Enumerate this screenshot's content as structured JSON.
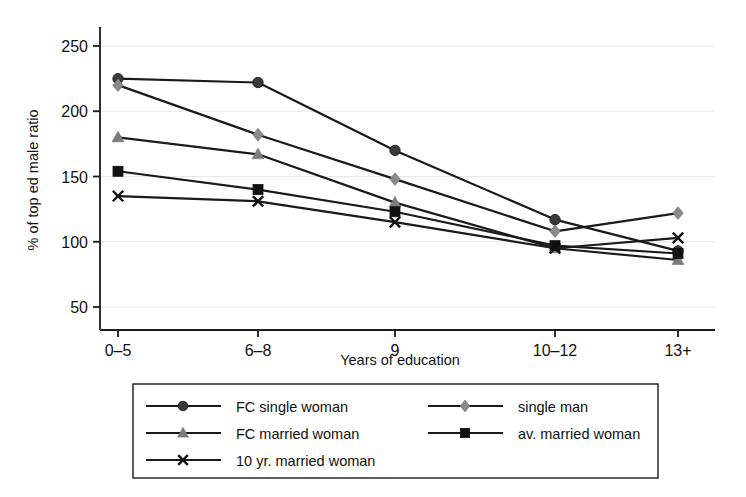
{
  "chart_data": {
    "type": "line",
    "title": "",
    "xlabel": "Years of education",
    "ylabel": "% of top ed male ratio",
    "categories": [
      "0–5",
      "6–8",
      "9",
      "10–12",
      "13+"
    ],
    "ylim": [
      50,
      250
    ],
    "yticks": [
      50,
      100,
      150,
      200,
      250
    ],
    "ytick_labels": [
      "50",
      "100",
      "150",
      "200",
      "250"
    ],
    "grid": "horizontal",
    "legend_position": "below-plot",
    "series": [
      {
        "name": "FC single woman",
        "marker": "circle",
        "color": "#3a3a3a",
        "values": [
          225,
          222,
          170,
          117,
          93
        ]
      },
      {
        "name": "single man",
        "marker": "diamond",
        "color": "#8a8a8a",
        "values": [
          220,
          182,
          148,
          108,
          122
        ]
      },
      {
        "name": "FC married woman",
        "marker": "triangle",
        "color": "#7d7d7d",
        "values": [
          180,
          167,
          130,
          95,
          86
        ]
      },
      {
        "name": "av. married woman",
        "marker": "square",
        "color": "#111111",
        "values": [
          154,
          140,
          123,
          97,
          91
        ]
      },
      {
        "name": "10 yr. married woman",
        "marker": "x",
        "color": "#111111",
        "values": [
          135,
          131,
          115,
          95,
          103
        ]
      }
    ]
  },
  "axes": {
    "x_label": "Years of education",
    "y_label": "% of top ed male ratio",
    "x_tick_labels": [
      "0–5",
      "6–8",
      "9",
      "10–12",
      "13+"
    ],
    "y_tick_labels": [
      "50",
      "100",
      "150",
      "200",
      "250"
    ]
  },
  "legend": {
    "entries": [
      {
        "label": "FC single woman",
        "marker": "circle",
        "color": "#3a3a3a"
      },
      {
        "label": "single man",
        "marker": "diamond",
        "color": "#8a8a8a"
      },
      {
        "label": "FC married woman",
        "marker": "triangle",
        "color": "#7d7d7d"
      },
      {
        "label": "av. married woman",
        "marker": "square",
        "color": "#111111"
      },
      {
        "label": "10 yr. married woman",
        "marker": "x",
        "color": "#111111"
      }
    ]
  },
  "colors": {
    "line": "#1a1a1a",
    "grid": "#e8e8e8",
    "axis": "#1a1a1a",
    "background": "#ffffff"
  }
}
